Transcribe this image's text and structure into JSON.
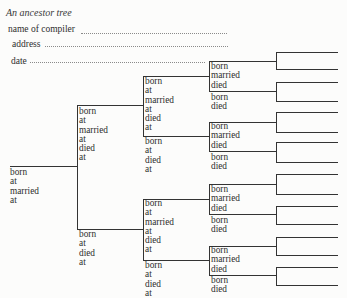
{
  "header": {
    "title": "An ancestor tree",
    "fields": [
      {
        "label": "name of compiler",
        "value": ""
      },
      {
        "label": "address",
        "value": ""
      },
      {
        "label": "date",
        "value": ""
      }
    ]
  },
  "tree": {
    "colors": {
      "line": "#333333",
      "text": "#2e2e2e",
      "dots": "#8a8a8a"
    },
    "gen1": [
      {
        "lines": [
          "born",
          "at",
          "married",
          "at"
        ]
      }
    ],
    "gen2": [
      {
        "lines": [
          "born",
          "at",
          "married",
          "at",
          "died",
          "at"
        ]
      },
      {
        "lines": [
          "born",
          "at",
          "died",
          "at"
        ]
      }
    ],
    "gen3": [
      {
        "lines": [
          "born",
          "at",
          "married",
          "at",
          "died",
          "at"
        ]
      },
      {
        "lines": [
          "born",
          "at",
          "died",
          "at"
        ]
      },
      {
        "lines": [
          "born",
          "at",
          "married",
          "at",
          "died",
          "at"
        ]
      },
      {
        "lines": [
          "born",
          "at",
          "died",
          "at"
        ]
      }
    ],
    "gen4": [
      {
        "lines": [
          "born",
          "married",
          "died"
        ]
      },
      {
        "lines": [
          "born",
          "died"
        ]
      },
      {
        "lines": [
          "born",
          "married",
          "died"
        ]
      },
      {
        "lines": [
          "born",
          "died"
        ]
      },
      {
        "lines": [
          "born",
          "married",
          "died"
        ]
      },
      {
        "lines": [
          "born",
          "died"
        ]
      },
      {
        "lines": [
          "born",
          "married",
          "died"
        ]
      },
      {
        "lines": [
          "born",
          "died"
        ]
      }
    ],
    "gen5_slots": 16
  }
}
